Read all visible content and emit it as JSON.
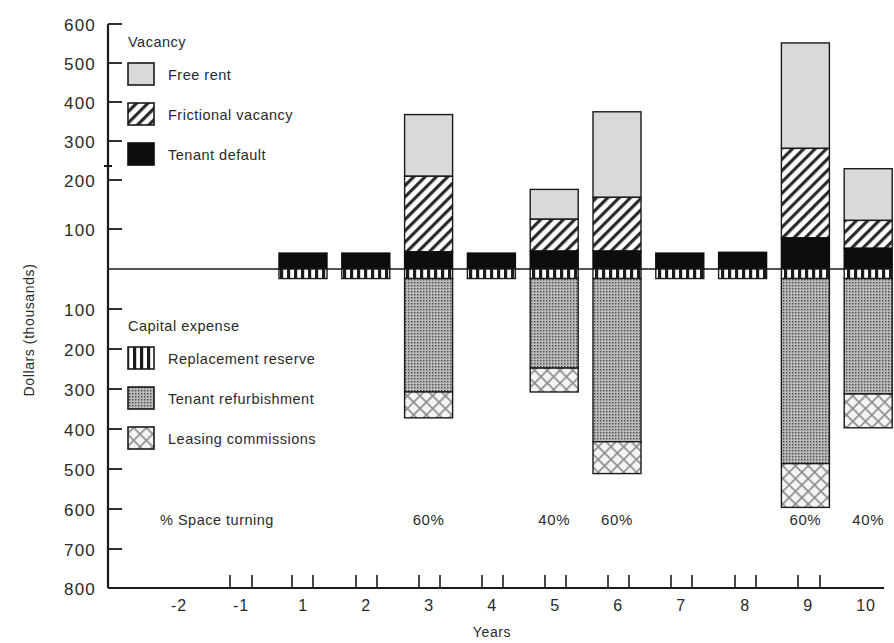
{
  "chart_data": {
    "type": "bar",
    "title": "",
    "subtype": "stacked-bar-diverging",
    "xlabel": "Years",
    "ylabel": "Dollars (thousands)",
    "x_tick_labels": [
      "-2",
      "-1",
      "1",
      "2",
      "3",
      "4",
      "5",
      "6",
      "7",
      "8",
      "9",
      "10"
    ],
    "x_tick_values": [
      -2,
      -1,
      1,
      2,
      3,
      4,
      5,
      6,
      7,
      8,
      9,
      10
    ],
    "y_tick_labels_above": [
      "600",
      "500",
      "400",
      "300",
      "200",
      "100"
    ],
    "y_tick_labels_below": [
      "100",
      "200",
      "300",
      "400",
      "500",
      "600",
      "700",
      "800"
    ],
    "ylim": [
      -800,
      600
    ],
    "grid": false,
    "zero_line": true,
    "categories": [
      "1",
      "2",
      "3",
      "4",
      "5",
      "6",
      "7",
      "8",
      "9",
      "10"
    ],
    "series": [
      {
        "name": "Free rent",
        "key": "free_rent",
        "sign": "positive",
        "values": [
          0,
          0,
          155,
          0,
          75,
          215,
          0,
          0,
          265,
          130
        ]
      },
      {
        "name": "Frictional vacancy",
        "key": "frictional_vacancy",
        "sign": "positive",
        "values": [
          0,
          0,
          190,
          0,
          80,
          135,
          0,
          0,
          225,
          70
        ]
      },
      {
        "name": "Tenant default",
        "key": "tenant_default",
        "sign": "positive",
        "values": [
          40,
          40,
          43,
          40,
          45,
          45,
          40,
          42,
          78,
          52
        ]
      },
      {
        "name": "Replacement reserve",
        "key": "replacement_reserve",
        "sign": "negative",
        "values": [
          24,
          24,
          24,
          24,
          24,
          24,
          24,
          24,
          24,
          24
        ]
      },
      {
        "name": "Tenant refurbishment",
        "key": "tenant_refurbishment",
        "sign": "negative",
        "values": [
          0,
          0,
          285,
          0,
          225,
          410,
          0,
          0,
          465,
          290
        ]
      },
      {
        "name": "Leasing commissions",
        "key": "leasing_commissions",
        "sign": "negative",
        "values": [
          0,
          0,
          65,
          0,
          60,
          80,
          0,
          0,
          110,
          85
        ]
      }
    ],
    "annotations": {
      "row_label": "% Space turning",
      "points": [
        {
          "year": 3,
          "label": "60%"
        },
        {
          "year": 5,
          "label": "40%"
        },
        {
          "year": 6,
          "label": "60%"
        },
        {
          "year": 9,
          "label": "60%"
        },
        {
          "year": 10,
          "label": "40%"
        }
      ]
    }
  },
  "legend_top": {
    "title": "Vacancy",
    "items": [
      {
        "label": "Free rent",
        "pattern": "light-gray-solid"
      },
      {
        "label": "Frictional vacancy",
        "pattern": "diagonal-hatch"
      },
      {
        "label": "Tenant default",
        "pattern": "solid-black"
      }
    ]
  },
  "legend_bottom": {
    "title": "Capital expense",
    "items": [
      {
        "label": "Replacement reserve",
        "pattern": "vertical-stripes"
      },
      {
        "label": "Tenant refurbishment",
        "pattern": "fine-dot-screen"
      },
      {
        "label": "Leasing commissions",
        "pattern": "cross-hatch"
      }
    ]
  },
  "axes": {
    "y_title": "Dollars (thousands)",
    "x_title": "Years"
  },
  "colors": {
    "ink": "#1a1a1a",
    "free_rent": "#d9d9d9",
    "tenant_default": "#0d0d0d",
    "tenant_refurbishment": "#b5b5b5",
    "background": "#ffffff"
  }
}
